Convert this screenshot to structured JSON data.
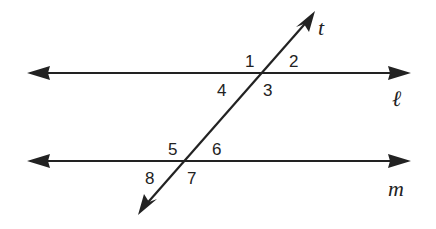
{
  "diagram": {
    "lines": {
      "l": {
        "label": "ℓ"
      },
      "m": {
        "label": "m"
      },
      "t": {
        "label": "t"
      }
    },
    "angles": [
      "1",
      "2",
      "3",
      "4",
      "5",
      "6",
      "7",
      "8"
    ],
    "colors": {
      "stroke": "#222222",
      "background": "#ffffff"
    }
  }
}
